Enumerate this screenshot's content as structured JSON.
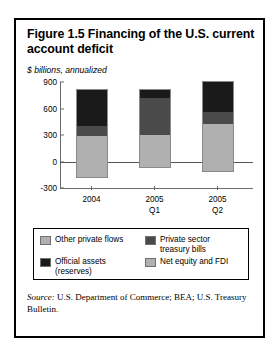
{
  "figure": {
    "title": "Figure 1.5  Financing of the U.S. current account deficit",
    "subtitle": "$ billions, annualized",
    "source_prefix": "Source:",
    "source_text": " U.S. Department of Commerce; BEA; U.S. Treasury Bulletin."
  },
  "colors": {
    "other_private_flows": "#b0b0b0",
    "private_sector_treasury_bills": "#4a4a4a",
    "official_assets": "#1a1a1a",
    "net_equity_and_fdi": "#b0b0b0",
    "axis": "#6b6b6b",
    "frame": "#000000"
  },
  "chart_data": {
    "type": "bar",
    "subtype": "stacked",
    "title": "Figure 1.5  Financing of the U.S. current account deficit",
    "subtitle": "$ billions, annualized",
    "xlabel": "",
    "ylabel": "$ billions, annualized",
    "categories": [
      "2004",
      "2005\nQ1",
      "2005\nQ2"
    ],
    "ylim": [
      -300,
      900
    ],
    "yticks": [
      -300,
      0,
      300,
      600,
      900
    ],
    "ytick_labels": [
      "-300",
      "0",
      "300",
      "600",
      "900"
    ],
    "grid": false,
    "legend_position": "below-plot",
    "series": [
      {
        "name": "Official assets (reserves)",
        "key": "official_assets",
        "color": "#1a1a1a",
        "values": [
          400,
          100,
          340
        ]
      },
      {
        "name": "Private sector treasury bills",
        "key": "private_sector_treasury_bills",
        "color": "#4a4a4a",
        "values": [
          115,
          410,
          130
        ]
      },
      {
        "name": "Net equity and FDI",
        "key": "net_equity_and_fdi",
        "color": "#b0b0b0",
        "values": [
          290,
          305,
          425
        ]
      },
      {
        "name": "Other private flows",
        "key": "other_private_flows",
        "color": "#b0b0b0",
        "values": [
          -175,
          -60,
          -110
        ]
      }
    ]
  },
  "legend": {
    "items": [
      {
        "label": "Other private flows",
        "color": "#b0b0b0"
      },
      {
        "label": "Private sector\ntreasury bills",
        "color": "#4a4a4a"
      },
      {
        "label": "Official assets\n(reserves)",
        "color": "#1a1a1a"
      },
      {
        "label": "Net equity and FDI",
        "color": "#b0b0b0"
      }
    ]
  }
}
